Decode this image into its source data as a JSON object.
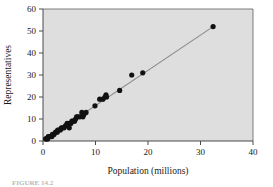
{
  "figure": {
    "caption_partial": "FIGURE 14.2"
  },
  "chart_data": {
    "type": "scatter",
    "title": "",
    "xlabel": "Population (millions)",
    "ylabel": "Representatives",
    "xlim": [
      0,
      40
    ],
    "ylim": [
      0,
      60
    ],
    "xticks": [
      0,
      10,
      20,
      30,
      40
    ],
    "yticks": [
      0,
      10,
      20,
      30,
      40,
      50,
      60
    ],
    "grid": false,
    "legend": "none",
    "plot_background": "#dedede",
    "point_color": "#111111",
    "line_color": "#8c8c8c",
    "axis_color": "#4a4a4a",
    "point_radius": 2.6,
    "points": [
      {
        "x": 0.5,
        "y": 1
      },
      {
        "x": 0.6,
        "y": 1
      },
      {
        "x": 0.8,
        "y": 1
      },
      {
        "x": 0.9,
        "y": 1
      },
      {
        "x": 1.0,
        "y": 2
      },
      {
        "x": 1.2,
        "y": 2
      },
      {
        "x": 1.3,
        "y": 2
      },
      {
        "x": 1.7,
        "y": 2
      },
      {
        "x": 1.8,
        "y": 3
      },
      {
        "x": 2.1,
        "y": 3
      },
      {
        "x": 2.4,
        "y": 4
      },
      {
        "x": 2.7,
        "y": 4
      },
      {
        "x": 2.8,
        "y": 5
      },
      {
        "x": 3.0,
        "y": 5
      },
      {
        "x": 3.3,
        "y": 5
      },
      {
        "x": 3.5,
        "y": 6
      },
      {
        "x": 3.7,
        "y": 6
      },
      {
        "x": 4.0,
        "y": 6
      },
      {
        "x": 4.3,
        "y": 7
      },
      {
        "x": 4.5,
        "y": 7
      },
      {
        "x": 4.6,
        "y": 8
      },
      {
        "x": 4.8,
        "y": 7
      },
      {
        "x": 5.0,
        "y": 6
      },
      {
        "x": 5.1,
        "y": 8
      },
      {
        "x": 5.3,
        "y": 8
      },
      {
        "x": 5.5,
        "y": 9
      },
      {
        "x": 5.7,
        "y": 9
      },
      {
        "x": 6.0,
        "y": 9
      },
      {
        "x": 6.2,
        "y": 10
      },
      {
        "x": 6.4,
        "y": 11
      },
      {
        "x": 6.6,
        "y": 11
      },
      {
        "x": 7.0,
        "y": 11
      },
      {
        "x": 7.4,
        "y": 13
      },
      {
        "x": 7.6,
        "y": 11
      },
      {
        "x": 7.8,
        "y": 12
      },
      {
        "x": 8.2,
        "y": 13
      },
      {
        "x": 9.9,
        "y": 16
      },
      {
        "x": 10.8,
        "y": 19
      },
      {
        "x": 11.4,
        "y": 19
      },
      {
        "x": 11.8,
        "y": 20
      },
      {
        "x": 12.0,
        "y": 21
      },
      {
        "x": 12.1,
        "y": 20
      },
      {
        "x": 14.6,
        "y": 23
      },
      {
        "x": 16.9,
        "y": 30
      },
      {
        "x": 19.0,
        "y": 31
      },
      {
        "x": 32.4,
        "y": 52
      }
    ],
    "fit_line": {
      "label": "least-squares regression line",
      "x_start": 0.4,
      "y_start": 0.7,
      "x_end": 32.4,
      "y_end": 52.0
    }
  }
}
